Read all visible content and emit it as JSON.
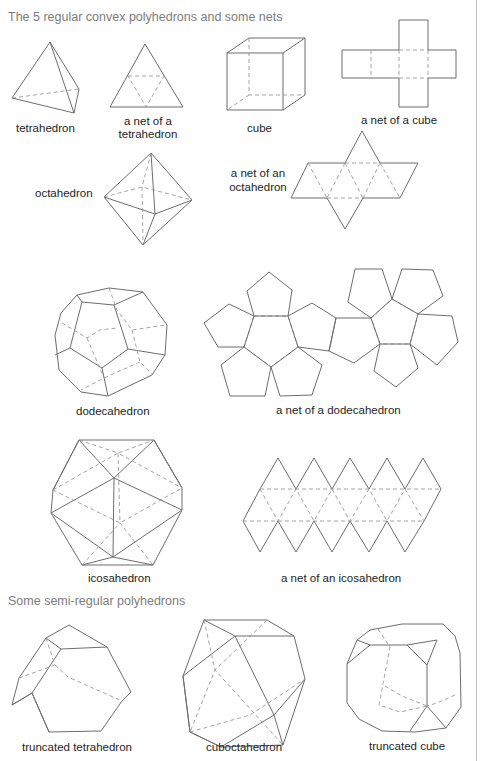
{
  "sections": [
    {
      "heading": "The 5 regular convex polyhedrons and some nets"
    },
    {
      "heading": "Some semi-regular polyhedrons"
    }
  ],
  "labels": {
    "tetrahedron": "tetrahedron",
    "tetra_net_1": "a net of a",
    "tetra_net_2": "tetrahedron",
    "cube": "cube",
    "cube_net": "a net of a cube",
    "octahedron": "octahedron",
    "octa_net_1": "a net of an",
    "octa_net_2": "octahedron",
    "dodecahedron": "dodecahedron",
    "dodeca_net": "a net of a dodecahedron",
    "icosahedron": "icosahedron",
    "icosa_net": "a net of an icosahedron",
    "truncated_tetrahedron": "truncated tetrahedron",
    "cuboctahedron": "cuboctahedron",
    "truncated_cube": "truncated cube"
  },
  "colors": {
    "heading": "#7d7d7d",
    "label": "#1e1e1e",
    "stroke": "#6d6d6d",
    "dashed": "#9a9a9a"
  }
}
